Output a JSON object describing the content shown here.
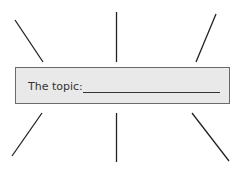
{
  "diagram": {
    "center_label": "The topic:",
    "center_blank_value": "",
    "spokes_count": 6,
    "colors": {
      "box_fill": "#e9e9e9",
      "box_border": "#6a6a6a",
      "line": "#222222",
      "text": "#333333"
    }
  }
}
